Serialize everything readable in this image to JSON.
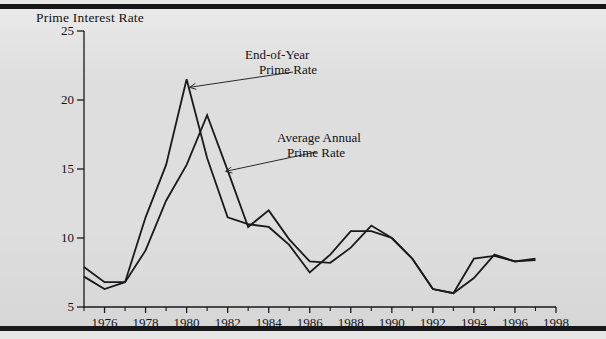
{
  "figure": {
    "background_color": "#dedede",
    "rule_color": "#17171a",
    "line_color": "#1a1a1c"
  },
  "chart_data": {
    "type": "line",
    "title": "",
    "ylabel": "Prime Interest Rate",
    "xlabel": "",
    "xlim": [
      1975,
      1998
    ],
    "ylim": [
      5,
      25
    ],
    "grid": false,
    "legend_position": "inline-annotations",
    "x_tick_labels": [
      "1976",
      "1978",
      "1980",
      "1982",
      "1984",
      "1986",
      "1988",
      "1990",
      "1992",
      "1994",
      "1996",
      "1998"
    ],
    "x_tick_values": [
      1976,
      1978,
      1980,
      1982,
      1984,
      1986,
      1988,
      1990,
      1992,
      1994,
      1996,
      1998
    ],
    "x_minor_tick_values": [
      1975,
      1977,
      1979,
      1981,
      1983,
      1985,
      1987,
      1989,
      1991,
      1993,
      1995,
      1997
    ],
    "y_tick_labels": [
      "25",
      "20",
      "15",
      "10",
      "5"
    ],
    "y_tick_values": [
      25,
      20,
      15,
      10,
      5
    ],
    "x": [
      1975,
      1976,
      1977,
      1978,
      1979,
      1980,
      1981,
      1982,
      1983,
      1984,
      1985,
      1986,
      1987,
      1988,
      1989,
      1990,
      1991,
      1992,
      1993,
      1994,
      1995,
      1996,
      1997
    ],
    "series": [
      {
        "name": "End-of-Year Prime Rate",
        "values": [
          7.9,
          6.8,
          6.8,
          11.5,
          15.3,
          21.5,
          15.8,
          11.5,
          11.0,
          10.8,
          9.5,
          7.5,
          8.8,
          10.5,
          10.5,
          10.0,
          8.5,
          6.3,
          6.0,
          8.5,
          8.7,
          8.3,
          8.4
        ]
      },
      {
        "name": "Average Annual Prime Rate",
        "values": [
          7.2,
          6.3,
          6.8,
          9.1,
          12.7,
          15.3,
          18.9,
          14.9,
          10.8,
          12.0,
          9.9,
          8.3,
          8.2,
          9.3,
          10.9,
          10.0,
          8.5,
          6.3,
          6.0,
          7.1,
          8.8,
          8.3,
          8.5
        ]
      }
    ],
    "annotations": [
      {
        "text_line1": "End-of-Year",
        "text_line2": "Prime Rate",
        "points_to_year": 1980,
        "points_to_value": 21.5
      },
      {
        "text_line1": "Average Annual",
        "text_line2": "Prime Rate",
        "points_to_year": 1982,
        "points_to_value": 14.9
      }
    ]
  }
}
